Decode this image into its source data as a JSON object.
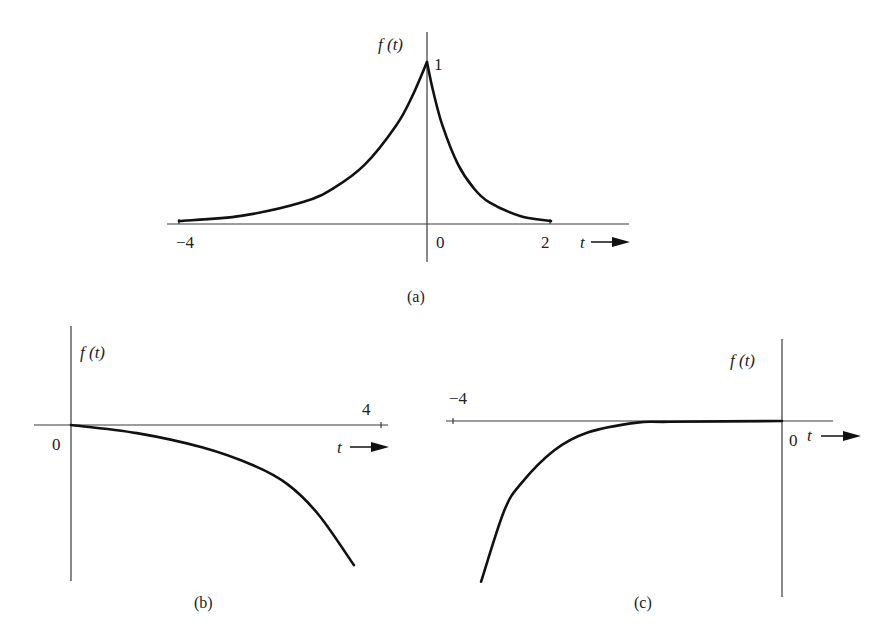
{
  "figures": {
    "a": {
      "caption": "(a)",
      "ylabel": "f (t)",
      "xlabel": "t",
      "peak_label": "1",
      "ticks": {
        "left": "−4",
        "origin": "0",
        "right": "2"
      }
    },
    "b": {
      "caption": "(b)",
      "ylabel": "f (t)",
      "xlabel": "t",
      "ticks": {
        "origin": "0",
        "right": "4"
      }
    },
    "c": {
      "caption": "(c)",
      "ylabel": "f (t)",
      "xlabel": "t",
      "ticks": {
        "left": "−4",
        "origin": "0"
      }
    }
  },
  "chart_data": [
    {
      "id": "a",
      "type": "line",
      "title": "(a)",
      "xlabel": "t",
      "ylabel": "f(t)",
      "xlim": [
        -4,
        2
      ],
      "ylim": [
        0,
        1
      ],
      "x_ticks": [
        -4,
        0,
        2
      ],
      "y_ticks": [
        1
      ],
      "description": "Two-sided exponential: e^{t} for t<0, e^{-2t} for t>=0, peak 1 at t=0",
      "series": [
        {
          "name": "f(t), t<0",
          "x": [
            -4,
            -3,
            -2,
            -1.5,
            -1,
            -0.5,
            -0.25,
            0
          ],
          "y": [
            0.018,
            0.05,
            0.135,
            0.223,
            0.368,
            0.607,
            0.779,
            1.0
          ]
        },
        {
          "name": "f(t), t>=0",
          "x": [
            0,
            0.1,
            0.25,
            0.5,
            0.75,
            1,
            1.5,
            2
          ],
          "y": [
            1.0,
            0.819,
            0.607,
            0.368,
            0.223,
            0.135,
            0.05,
            0.018
          ]
        }
      ]
    },
    {
      "id": "b",
      "type": "line",
      "title": "(b)",
      "xlabel": "t",
      "ylabel": "f(t)",
      "xlim": [
        0,
        4
      ],
      "x_ticks": [
        0,
        4
      ],
      "description": "Decreasing curve starting at 0, falling increasingly steeply (negative growing exponential)",
      "series": [
        {
          "name": "f(t)",
          "x": [
            0,
            0.85,
            1.7,
            2.35,
            2.8,
            3.2,
            3.65
          ],
          "y": [
            0,
            -0.05,
            -0.14,
            -0.25,
            -0.37,
            -0.56,
            -0.87
          ]
        }
      ]
    },
    {
      "id": "c",
      "type": "line",
      "title": "(c)",
      "xlabel": "t",
      "ylabel": "f(t)",
      "xlim": [
        -4,
        0
      ],
      "x_ticks": [
        -4,
        0
      ],
      "description": "Curve approaching 0 from below as t→0, dropping steeply near t=-4",
      "series": [
        {
          "name": "f(t)",
          "x": [
            -3.67,
            -3.39,
            -3.18,
            -2.78,
            -2.37,
            -1.77,
            -1.37,
            0
          ],
          "y": [
            -0.98,
            -0.55,
            -0.38,
            -0.18,
            -0.07,
            -0.01,
            -0.005,
            0
          ]
        }
      ]
    }
  ]
}
